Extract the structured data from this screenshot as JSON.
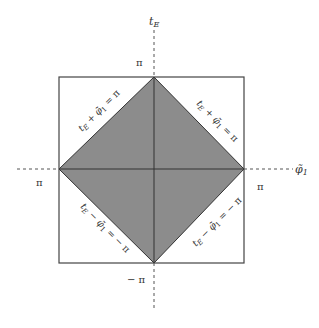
{
  "diagram": {
    "colors": {
      "fill": "#8c8c8c",
      "stroke": "#444444",
      "axis": "#555555",
      "text": "#333333",
      "background": "#ffffff"
    },
    "axes": {
      "vertical_label": "t",
      "vertical_label_sub": "E",
      "horizontal_label": "φ̃",
      "horizontal_label_sub": "1"
    },
    "ticks": {
      "top": "π",
      "bottom": "− π",
      "left": "π",
      "right": "π"
    },
    "edge_labels": {
      "upper_left": {
        "t": "t",
        "sub": "E",
        "op": " + ",
        "phi": "φ̃",
        "phisub": "1",
        "rhs": " = π"
      },
      "upper_right": {
        "t": "t",
        "sub": "E",
        "op": " + ",
        "phi": "φ̃",
        "phisub": "1",
        "rhs": " = π"
      },
      "lower_left": {
        "t": "t",
        "sub": "E",
        "op": " − ",
        "phi": "φ̃",
        "phisub": "1",
        "rhs": " = − π"
      },
      "lower_right": {
        "t": "t",
        "sub": "E",
        "op": " − ",
        "phi": "φ̃",
        "phisub": "1",
        "rhs": " = − π"
      }
    }
  }
}
